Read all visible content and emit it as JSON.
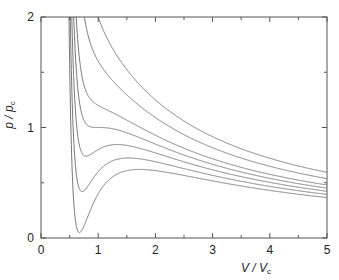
{
  "chart_data": {
    "type": "line",
    "title": "",
    "xlabel": {
      "main": "V / V",
      "sub": "c"
    },
    "ylabel": {
      "main": "p / p",
      "sub": "c"
    },
    "xlim": [
      0,
      5
    ],
    "ylim": [
      0,
      2
    ],
    "x_ticks": [
      0,
      1,
      2,
      3,
      4,
      5
    ],
    "x_minor_ticks": [
      0.5,
      1.5,
      2.5,
      3.5,
      4.5
    ],
    "y_ticks": [
      0,
      1,
      2
    ],
    "y_minor_ticks": [
      0.5,
      1.5
    ],
    "x_tick_labels": [
      "0",
      "1",
      "2",
      "3",
      "4",
      "5"
    ],
    "y_tick_labels": [
      "0",
      "1",
      "2"
    ],
    "grid": false,
    "legend": "none",
    "model": "reduced van der Waals isotherms p = 8T/(3V-1) - 3/V^2",
    "series": [
      {
        "name": "T/Tc=0.85",
        "T": 0.85
      },
      {
        "name": "T/Tc=0.90",
        "T": 0.9
      },
      {
        "name": "T/Tc=0.95",
        "T": 0.95
      },
      {
        "name": "T/Tc=1.00",
        "T": 1.0
      },
      {
        "name": "T/Tc=1.05",
        "T": 1.05
      },
      {
        "name": "T/Tc=1.15",
        "T": 1.15
      },
      {
        "name": "T/Tc=1.25",
        "T": 1.25
      }
    ]
  }
}
